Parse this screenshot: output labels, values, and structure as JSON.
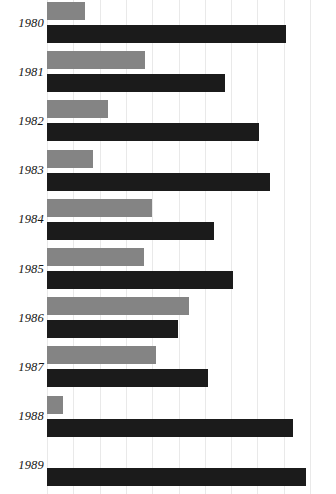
{
  "chart_data": {
    "type": "bar",
    "orientation": "horizontal",
    "title": "",
    "subtitle": "",
    "xlabel": "",
    "ylabel": "",
    "grid": true,
    "grid_axis": "x",
    "legend": "none",
    "legend_entries": [],
    "axis_tick_labels": [],
    "xlim": [
      0,
      11
    ],
    "categories": [
      "1980",
      "1981",
      "1982",
      "1983",
      "1984",
      "1985",
      "1986",
      "1987",
      "1988",
      "1989"
    ],
    "series": [
      {
        "name": "light-gray-series",
        "color": "#848484",
        "values": [
          1.45,
          3.72,
          2.32,
          1.75,
          3.99,
          3.69,
          5.4,
          4.14,
          0.61,
          0.0
        ]
      },
      {
        "name": "dark-series",
        "color": "#1b1b1b",
        "values": [
          9.09,
          6.77,
          8.06,
          8.48,
          6.35,
          7.07,
          4.98,
          6.12,
          9.35,
          9.85
        ]
      }
    ],
    "bar_pixel_lengths": {
      "light": [
        38,
        98,
        61,
        46,
        105,
        97,
        142,
        109,
        16,
        0
      ],
      "dark": [
        239,
        178,
        212,
        223,
        167,
        186,
        131,
        161,
        246,
        259
      ]
    },
    "plot_origin_x": 47,
    "gridline_spacing_px": 26.3,
    "gridline_count": 11,
    "colors": {
      "background": "#ffffff",
      "gridline": "#e9e9e9",
      "light_bar": "#848484",
      "dark_bar": "#1b1b1b",
      "label_text": "#141414"
    },
    "rows": [
      {
        "year": "1980",
        "light": 38,
        "dark": 239
      },
      {
        "year": "1981",
        "light": 98,
        "dark": 178
      },
      {
        "year": "1982",
        "light": 61,
        "dark": 212
      },
      {
        "year": "1983",
        "light": 46,
        "dark": 223
      },
      {
        "year": "1984",
        "light": 105,
        "dark": 167
      },
      {
        "year": "1985",
        "light": 97,
        "dark": 186
      },
      {
        "year": "1986",
        "light": 142,
        "dark": 131
      },
      {
        "year": "1987",
        "light": 109,
        "dark": 161
      },
      {
        "year": "1988",
        "light": 16,
        "dark": 246
      },
      {
        "year": "1989",
        "light": 0,
        "dark": 259
      }
    ]
  }
}
